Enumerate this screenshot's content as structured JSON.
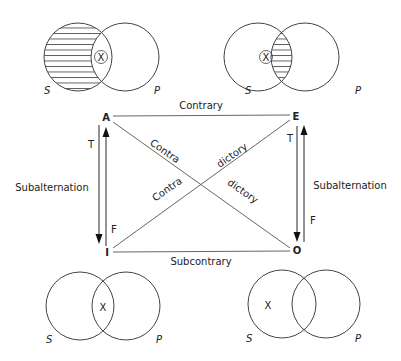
{
  "diagram": {
    "corners": {
      "A": "A",
      "E": "E",
      "I": "I",
      "O": "O"
    },
    "relations": {
      "top": "Contrary",
      "bottom": "Subcontrary",
      "left": "Subalternation",
      "right": "Subalternation",
      "diag1_a": "Contra",
      "diag1_b": "dictory",
      "diag2_a": "Contra",
      "diag2_b": "dictory"
    },
    "truth_labels": {
      "left_t": "T",
      "left_f": "F",
      "right_t": "T",
      "right_f": "F"
    },
    "venn": [
      {
        "id": "A",
        "s_label": "S",
        "p_label": "P",
        "shaded": "S-only",
        "mark": "X",
        "mark_circled": true,
        "mark_region": "intersection"
      },
      {
        "id": "E",
        "s_label": "S",
        "p_label": "P",
        "shaded": "intersection",
        "mark": "X",
        "mark_circled": true,
        "mark_region": "S-only"
      },
      {
        "id": "I",
        "s_label": "S",
        "p_label": "P",
        "shaded": "none",
        "mark": "X",
        "mark_circled": false,
        "mark_region": "intersection"
      },
      {
        "id": "O",
        "s_label": "S",
        "p_label": "P",
        "shaded": "none",
        "mark": "X",
        "mark_circled": false,
        "mark_region": "S-only"
      }
    ]
  }
}
